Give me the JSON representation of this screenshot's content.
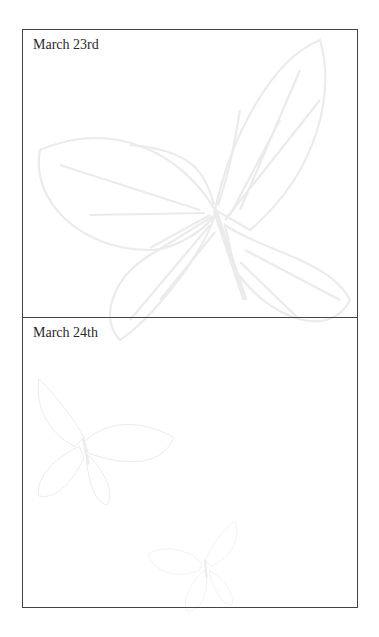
{
  "journal": {
    "entries": [
      {
        "date": "March 23rd",
        "body": ""
      },
      {
        "date": "March 24th",
        "body": ""
      }
    ]
  },
  "decoration": {
    "watermark_icon": "butterfly-icon",
    "watermark_color": "#ececec",
    "border_color": "#444444"
  }
}
